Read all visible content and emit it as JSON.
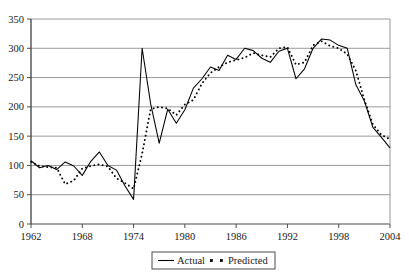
{
  "chart_data": {
    "type": "line",
    "title": "",
    "xlabel": "",
    "ylabel": "",
    "xlim": [
      1962,
      2004
    ],
    "ylim": [
      0,
      350
    ],
    "ytick_values": [
      0,
      50,
      100,
      150,
      200,
      250,
      300,
      350
    ],
    "ytick_labels": [
      "0",
      "50",
      "100",
      "150",
      "200",
      "250",
      "300",
      "350"
    ],
    "xtick_values": [
      1962,
      1968,
      1974,
      1980,
      1986,
      1992,
      1998,
      2004
    ],
    "xtick_labels": [
      "1962",
      "1968",
      "1974",
      "1980",
      "1986",
      "1992",
      "1998",
      "2004"
    ],
    "grid": true,
    "grid_axis": "y",
    "grid_color": "#999999",
    "axis_color": "#4d4d4d",
    "legend": {
      "position": "below-axis-center",
      "entries": [
        {
          "name": "Actual",
          "style": "solid",
          "color": "#000000"
        },
        {
          "name": "Predicted",
          "style": "dotted",
          "color": "#000000"
        }
      ]
    },
    "x": [
      1962,
      1963,
      1964,
      1965,
      1966,
      1967,
      1968,
      1969,
      1970,
      1971,
      1972,
      1973,
      1974,
      1975,
      1976,
      1977,
      1978,
      1979,
      1980,
      1981,
      1982,
      1983,
      1984,
      1985,
      1986,
      1987,
      1988,
      1989,
      1990,
      1991,
      1992,
      1993,
      1994,
      1995,
      1996,
      1997,
      1998,
      1999,
      2000,
      2001,
      2002,
      2003,
      2004
    ],
    "series": [
      {
        "name": "Actual",
        "style": "solid",
        "color": "#000000",
        "values": [
          108,
          96,
          100,
          93,
          106,
          99,
          83,
          107,
          123,
          100,
          92,
          65,
          42,
          300,
          205,
          138,
          196,
          172,
          195,
          232,
          248,
          268,
          262,
          288,
          281,
          300,
          296,
          283,
          276,
          295,
          300,
          248,
          265,
          300,
          316,
          314,
          305,
          300,
          238,
          210,
          165,
          148,
          130
        ]
      },
      {
        "name": "Predicted",
        "style": "dotted",
        "color": "#000000",
        "values": [
          106,
          99,
          97,
          96,
          68,
          74,
          95,
          99,
          102,
          98,
          78,
          70,
          60,
          120,
          196,
          200,
          197,
          186,
          204,
          212,
          240,
          258,
          268,
          276,
          280,
          284,
          292,
          288,
          285,
          300,
          302,
          272,
          276,
          305,
          312,
          304,
          300,
          290,
          262,
          212,
          170,
          152,
          145
        ]
      }
    ]
  }
}
